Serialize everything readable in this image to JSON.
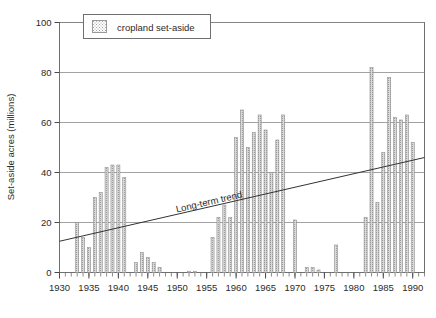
{
  "chart_data": {
    "type": "bar",
    "title": "",
    "subtitle": "",
    "xlabel": "",
    "ylabel": "Set-aside acres (millions)",
    "xlim": [
      1930,
      1992
    ],
    "ylim": [
      0,
      100
    ],
    "yticks": [
      0,
      20,
      40,
      60,
      80,
      100
    ],
    "xticks": [
      1930,
      1935,
      1940,
      1945,
      1950,
      1955,
      1960,
      1965,
      1970,
      1975,
      1980,
      1985,
      1990
    ],
    "xtick_labels": [
      "1930",
      "1935",
      "1940",
      "1945",
      "1950",
      "1955",
      "1960",
      "1965",
      "1970",
      "1975",
      "1980",
      "1985",
      "1990"
    ],
    "ytick_labels": [
      "0",
      "20",
      "40",
      "60",
      "80",
      "100"
    ],
    "grid": "horizontal",
    "minor_xticks_every": 1,
    "legend": {
      "position": "top-left-inside",
      "entries": [
        {
          "label": "cropland set-aside",
          "swatch": "#cccccc",
          "pattern": "dotted-fill"
        }
      ]
    },
    "annotations": [
      {
        "text": "Long-term trend",
        "x": 1955.5,
        "y": 27,
        "rotation": -13
      }
    ],
    "trendline": {
      "name": "Long-term trend",
      "x_start": 1930,
      "y_start": 12.5,
      "x_end": 1992,
      "y_end": 46.0,
      "color": "#333333"
    },
    "series": [
      {
        "name": "cropland set-aside",
        "color": "#b8b8b8",
        "categories": [
          1930,
          1931,
          1932,
          1933,
          1934,
          1935,
          1936,
          1937,
          1938,
          1939,
          1940,
          1941,
          1942,
          1943,
          1944,
          1945,
          1946,
          1947,
          1948,
          1949,
          1950,
          1951,
          1952,
          1953,
          1954,
          1955,
          1956,
          1957,
          1958,
          1959,
          1960,
          1961,
          1962,
          1963,
          1964,
          1965,
          1966,
          1967,
          1968,
          1969,
          1970,
          1971,
          1972,
          1973,
          1974,
          1975,
          1976,
          1977,
          1978,
          1979,
          1980,
          1981,
          1982,
          1983,
          1984,
          1985,
          1986,
          1987,
          1988,
          1989,
          1990,
          1991
        ],
        "values": [
          0,
          0,
          0,
          20,
          14,
          10,
          30,
          32,
          42,
          43,
          43,
          38,
          0,
          4,
          8,
          6,
          4,
          2,
          0,
          0,
          0,
          0,
          0.5,
          0.5,
          0,
          0,
          14,
          22,
          27,
          22,
          54,
          65,
          50,
          56,
          63,
          57,
          40,
          53,
          63,
          0,
          21,
          0,
          2,
          2,
          1,
          0,
          0,
          11,
          0,
          0,
          0,
          0,
          22,
          82,
          28,
          48,
          78,
          62,
          61,
          63,
          52,
          0
        ]
      }
    ]
  }
}
